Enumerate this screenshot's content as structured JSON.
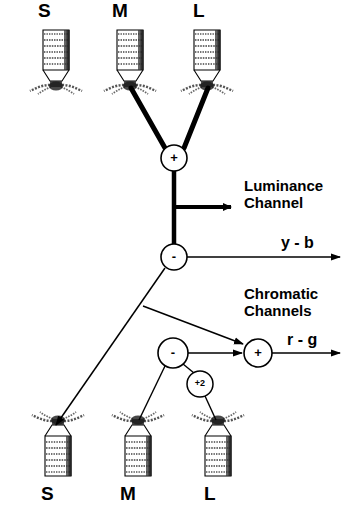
{
  "figure": {
    "background_color": "#ffffff",
    "ink_color": "#000000"
  },
  "top_row": {
    "labels": [
      {
        "text": "S",
        "x": 45,
        "y": 2
      },
      {
        "text": "M",
        "x": 118,
        "y": 2
      },
      {
        "text": "L",
        "x": 196,
        "y": 2
      }
    ],
    "cones": [
      {
        "name": "cone-s-top",
        "cx": 56,
        "cy": 30,
        "orientation": "up",
        "bands": 6
      },
      {
        "name": "cone-m-top",
        "cx": 130,
        "cy": 30,
        "orientation": "up",
        "bands": 6
      },
      {
        "name": "cone-l-top",
        "cx": 207,
        "cy": 30,
        "orientation": "up",
        "bands": 6
      }
    ]
  },
  "bottom_row": {
    "labels": [
      {
        "text": "S",
        "x": 48,
        "y": 487
      },
      {
        "text": "M",
        "x": 128,
        "y": 487
      },
      {
        "text": "L",
        "x": 209,
        "y": 487
      }
    ],
    "cones": [
      {
        "name": "cone-s-bottom",
        "cx": 58,
        "cy": 400,
        "orientation": "down",
        "bands": 6
      },
      {
        "name": "cone-m-bottom",
        "cx": 138,
        "cy": 400,
        "orientation": "down",
        "bands": 6
      },
      {
        "name": "cone-l-bottom",
        "cx": 218,
        "cy": 400,
        "orientation": "down",
        "bands": 6
      }
    ]
  },
  "nodes": [
    {
      "name": "sum-node-luminance",
      "symbol": "+",
      "cx": 174,
      "cy": 158,
      "r": 13,
      "size": "large"
    },
    {
      "name": "diff-node-yellow-blue",
      "symbol": "-",
      "cx": 174,
      "cy": 257,
      "r": 13,
      "size": "large"
    },
    {
      "name": "diff-node-chromatic",
      "symbol": "-",
      "cx": 173,
      "cy": 353,
      "r": 15,
      "size": "large"
    },
    {
      "name": "gain-node-plus-two",
      "symbol": "+2",
      "cx": 200,
      "cy": 384,
      "r": 13,
      "size": "small"
    },
    {
      "name": "sum-node-red-green",
      "symbol": "+",
      "cx": 258,
      "cy": 353,
      "r": 14,
      "size": "large"
    }
  ],
  "channel_labels": [
    {
      "name": "luminance-channel-label",
      "text": "Luminance\nChannel",
      "x": 244,
      "y": 182
    },
    {
      "name": "yellow-blue-output-label",
      "text": "y - b",
      "x": 281,
      "y": 237
    },
    {
      "name": "chromatic-channels-label",
      "text": "Chromatic\nChannels",
      "x": 244,
      "y": 289
    },
    {
      "name": "red-green-output-label",
      "text": "r - g",
      "x": 287,
      "y": 333
    }
  ],
  "connections": [
    {
      "name": "edge-m-cone-to-sum",
      "from": "cone-m-top",
      "to": "sum-node-luminance",
      "weight": "thick"
    },
    {
      "name": "edge-l-cone-to-sum",
      "from": "cone-l-top",
      "to": "sum-node-luminance",
      "weight": "thick"
    },
    {
      "name": "edge-sum-to-diff",
      "from": "sum-node-luminance",
      "to": "diff-node-yellow-blue",
      "weight": "thick"
    },
    {
      "name": "edge-luminance-output",
      "from": "sum-to-diff-trunk",
      "to": "luminance-channel-label",
      "weight": "thick",
      "arrow": true
    },
    {
      "name": "edge-yellow-blue-output",
      "from": "diff-node-yellow-blue",
      "to": "yellow-blue-output-label",
      "weight": "thin",
      "arrow": true
    },
    {
      "name": "edge-diff-to-s-cone",
      "from": "diff-node-yellow-blue",
      "to": "cone-s-bottom",
      "weight": "thin",
      "arrow": true
    },
    {
      "name": "edge-diff-to-sum-rg",
      "from": "diff-node-yellow-blue",
      "to": "sum-node-red-green",
      "weight": "thin",
      "arrow": true
    },
    {
      "name": "edge-chromatic-diff-to-sum-rg",
      "from": "diff-node-chromatic",
      "to": "sum-node-red-green",
      "weight": "thin",
      "arrow": true
    },
    {
      "name": "edge-chromatic-diff-to-m-cone",
      "from": "diff-node-chromatic",
      "to": "cone-m-bottom",
      "weight": "thin"
    },
    {
      "name": "edge-chromatic-diff-to-gain",
      "from": "diff-node-chromatic",
      "to": "gain-node-plus-two",
      "weight": "thin"
    },
    {
      "name": "edge-gain-to-l-cone",
      "from": "gain-node-plus-two",
      "to": "cone-l-bottom",
      "weight": "thin"
    },
    {
      "name": "edge-red-green-output",
      "from": "sum-node-red-green",
      "to": "red-green-output-label",
      "weight": "thin",
      "arrow": true
    }
  ]
}
